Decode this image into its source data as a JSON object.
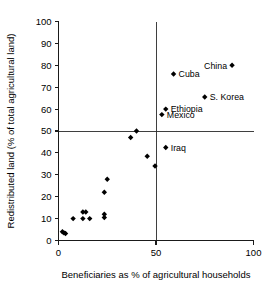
{
  "chart_data": {
    "type": "scatter",
    "title": "",
    "xlabel": "Beneficiaries as % of agricultural households",
    "ylabel": "Redistributed land (% of total agricultural land)",
    "xlim": [
      0,
      100
    ],
    "ylim": [
      0,
      100
    ],
    "xticks": [
      0,
      50,
      100
    ],
    "yticks": [
      0,
      10,
      20,
      30,
      40,
      50,
      60,
      70,
      80,
      90,
      100
    ],
    "xticklabels": [
      "0",
      "50",
      "100"
    ],
    "yticklabels": [
      "0",
      "10",
      "20",
      "30",
      "40",
      "50",
      "60",
      "70",
      "80",
      "90",
      "100"
    ],
    "grid": false,
    "legend": "none",
    "reference_lines": [
      {
        "name": "vertical-50",
        "axis": "x",
        "value": 50
      },
      {
        "name": "horizontal-50",
        "axis": "y",
        "value": 50
      }
    ],
    "points": [
      {
        "label": "China",
        "x": 89,
        "y": 80,
        "label_side": "left"
      },
      {
        "label": "Cuba",
        "x": 59,
        "y": 76,
        "label_side": "right"
      },
      {
        "label": "S. Korea",
        "x": 75,
        "y": 65.5,
        "label_side": "right"
      },
      {
        "label": "Ethiopia",
        "x": 55,
        "y": 60,
        "label_side": "right"
      },
      {
        "label": "Mexico",
        "x": 53,
        "y": 57.5,
        "label_side": "right"
      },
      {
        "label": "Iraq",
        "x": 55,
        "y": 42.5,
        "label_side": "right"
      },
      {
        "label": "",
        "x": 40,
        "y": 50,
        "label_side": "none"
      },
      {
        "label": "",
        "x": 37,
        "y": 47,
        "label_side": "none"
      },
      {
        "label": "",
        "x": 45.5,
        "y": 38.5,
        "label_side": "none"
      },
      {
        "label": "",
        "x": 49.5,
        "y": 34,
        "label_side": "none"
      },
      {
        "label": "",
        "x": 25,
        "y": 28,
        "label_side": "none"
      },
      {
        "label": "",
        "x": 23.5,
        "y": 22,
        "label_side": "none"
      },
      {
        "label": "",
        "x": 12.5,
        "y": 13,
        "label_side": "none"
      },
      {
        "label": "",
        "x": 14,
        "y": 13,
        "label_side": "none"
      },
      {
        "label": "",
        "x": 23.5,
        "y": 12,
        "label_side": "none"
      },
      {
        "label": "",
        "x": 23.5,
        "y": 10.5,
        "label_side": "none"
      },
      {
        "label": "",
        "x": 7.5,
        "y": 10,
        "label_side": "none"
      },
      {
        "label": "",
        "x": 12.5,
        "y": 10,
        "label_side": "none"
      },
      {
        "label": "",
        "x": 16,
        "y": 10,
        "label_side": "none"
      },
      {
        "label": "",
        "x": 2,
        "y": 4,
        "label_side": "none"
      },
      {
        "label": "",
        "x": 2.8,
        "y": 3.5,
        "label_side": "none"
      },
      {
        "label": "",
        "x": 3.6,
        "y": 3.2,
        "label_side": "none"
      }
    ]
  },
  "colors": {
    "marker": "#000000",
    "axis": "#1a1a1a",
    "reference_line": "#2a2a2a",
    "background": "#ffffff"
  }
}
